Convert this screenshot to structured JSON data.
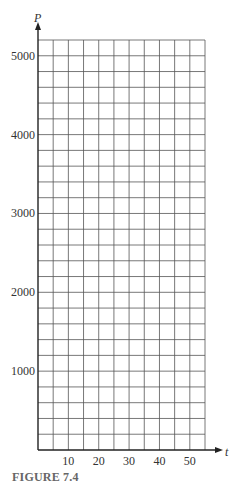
{
  "chart_data": {
    "type": "line",
    "title": "",
    "caption": "FIGURE 7.4",
    "xlabel": "t",
    "ylabel": "P",
    "xlim": [
      0,
      55
    ],
    "ylim": [
      0,
      5200
    ],
    "x_ticks": [
      10,
      20,
      30,
      40,
      50
    ],
    "y_ticks": [
      1000,
      2000,
      3000,
      4000,
      5000
    ],
    "x_grid_step": 5,
    "y_grid_step": 200,
    "grid": true,
    "series": [],
    "note": "Blank grid for plotting; no data points drawn"
  },
  "colors": {
    "grid": "#555555",
    "axis": "#222222",
    "caption": "#666666"
  }
}
